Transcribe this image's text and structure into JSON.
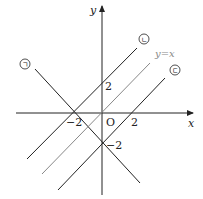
{
  "diagram": {
    "axes": {
      "x_label": "x",
      "y_label": "y",
      "origin_label": "O"
    },
    "ticks": {
      "x_neg": "−2",
      "x_pos": "2",
      "y_pos": "2",
      "y_neg": "−2"
    },
    "lines": [
      {
        "id": "giyeok",
        "marker": "ㄱ",
        "equation": "y=-x-2",
        "color": "#222222"
      },
      {
        "id": "nieun",
        "marker": "ㄴ",
        "equation": "y=x+2",
        "color": "#222222"
      },
      {
        "id": "identity",
        "marker": "",
        "label": "y=x",
        "equation": "y=x",
        "color": "#888888"
      },
      {
        "id": "digeut",
        "marker": "ㄷ",
        "equation": "y=x-2",
        "color": "#222222"
      }
    ]
  }
}
